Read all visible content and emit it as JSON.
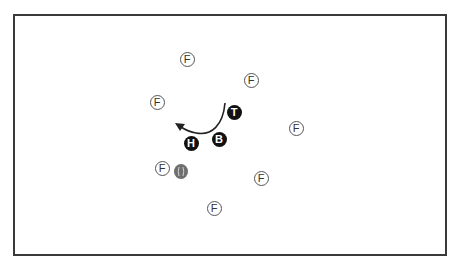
{
  "diagram": {
    "type": "ball-game drill diagram",
    "frame": {
      "left": 13,
      "top": 14,
      "right": 445,
      "bottom": 254,
      "border_color": "#3a3a3a"
    },
    "fielders": [
      {
        "label": "F",
        "x": 187,
        "y": 59
      },
      {
        "label": "F",
        "x": 251,
        "y": 80
      },
      {
        "label": "F",
        "x": 157,
        "y": 102
      },
      {
        "label": "F",
        "x": 296,
        "y": 128
      },
      {
        "label": "F",
        "x": 162,
        "y": 168
      },
      {
        "label": "F",
        "x": 261,
        "y": 178
      },
      {
        "label": "F",
        "x": 214,
        "y": 208
      }
    ],
    "players": [
      {
        "id": "tosser",
        "label": "T",
        "x": 234,
        "y": 112
      },
      {
        "id": "batter",
        "label": "B",
        "x": 219,
        "y": 139
      },
      {
        "id": "hitter",
        "label": "H",
        "x": 191,
        "y": 143
      }
    ],
    "ball": {
      "x": 181,
      "y": 171,
      "color": "#6f6f6f"
    },
    "arrow": {
      "description": "curved movement arrow from near T, bending down past B, ending pointing left-up near H",
      "path": "M 225 103 C 223 125, 212 136, 196 133 C 189 132, 184 129, 181 127",
      "head": {
        "x": 175,
        "y": 123
      },
      "color": "#222222"
    },
    "colors": {
      "player_fill": "#111111",
      "player_text": "#ffffff",
      "fielder_border": "#555555",
      "fielder_text": "#333333"
    }
  }
}
